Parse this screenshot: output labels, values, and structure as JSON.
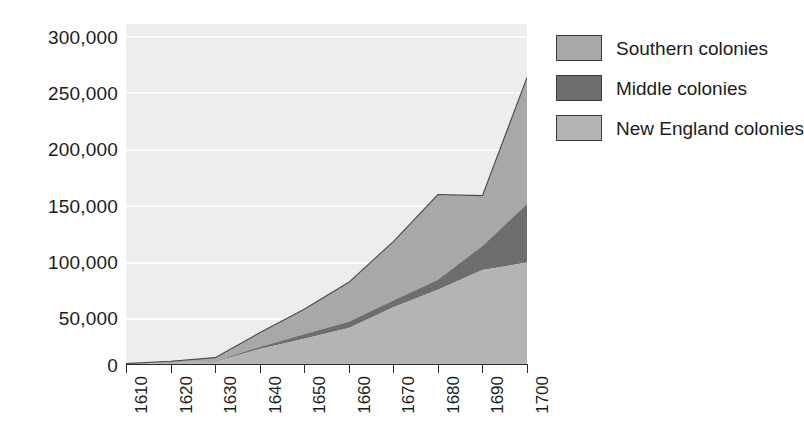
{
  "chart_data": {
    "type": "area",
    "stacked": true,
    "title": "",
    "subtitle": "",
    "xlabel": "",
    "ylabel": "",
    "categories": [
      "1610",
      "1620",
      "1630",
      "1640",
      "1650",
      "1660",
      "1670",
      "1680",
      "1690",
      "1700"
    ],
    "x": [
      1610,
      1620,
      1630,
      1640,
      1650,
      1660,
      1670,
      1680,
      1690,
      1700
    ],
    "xlim": [
      1610,
      1700
    ],
    "ylim": [
      0,
      300000
    ],
    "ytick_labels": [
      "0",
      "50,000",
      "100,000",
      "150,000",
      "200,000",
      "250,000",
      "300,000"
    ],
    "ytick_values": [
      0,
      50000,
      100000,
      150000,
      200000,
      250000,
      300000
    ],
    "grid": true,
    "legend_position": "right",
    "stack_order_bottom_to_top": [
      "New England colonies",
      "Middle colonies",
      "Southern colonies"
    ],
    "series": [
      {
        "name": "New England colonies",
        "color": "#b4b4b4",
        "values": [
          0,
          900,
          2000,
          13700,
          23000,
          33000,
          52000,
          68000,
          86000,
          92800
        ]
      },
      {
        "name": "Middle colonies",
        "color": "#6e6e6e",
        "values": [
          0,
          100,
          500,
          1900,
          4100,
          5700,
          6000,
          9000,
          22000,
          53500
        ]
      },
      {
        "name": "Southern colonies",
        "color": "#a8a8a8",
        "values": [
          350,
          1500,
          3300,
          13000,
          23000,
          36000,
          54000,
          78000,
          46000,
          115700
        ]
      }
    ],
    "totals": [
      350,
      2500,
      5800,
      28600,
      50100,
      74700,
      112000,
      155000,
      154000,
      262000
    ],
    "colors": {
      "southern": "#a8a8a8",
      "middle": "#6e6e6e",
      "new_england": "#b4b4b4",
      "plot_background": "#ededed",
      "gridline": "#fafafa",
      "axis": "#2b2b2b",
      "text": "#1c1c1c",
      "page_background": "#ffffff"
    }
  },
  "legend": {
    "items": [
      {
        "label": "Southern colonies",
        "color": "#a8a8a8",
        "swatch_name": "legend-swatch-southern"
      },
      {
        "label": "Middle colonies",
        "color": "#6e6e6e",
        "swatch_name": "legend-swatch-middle"
      },
      {
        "label": "New England colonies",
        "color": "#b4b4b4",
        "swatch_name": "legend-swatch-new-england"
      }
    ]
  },
  "y_axis": {
    "labels": [
      "300,000",
      "250,000",
      "200,000",
      "150,000",
      "100,000",
      "50,000",
      "0"
    ]
  },
  "x_axis": {
    "labels": [
      "1610",
      "1620",
      "1630",
      "1640",
      "1650",
      "1660",
      "1670",
      "1680",
      "1690",
      "1700"
    ]
  }
}
